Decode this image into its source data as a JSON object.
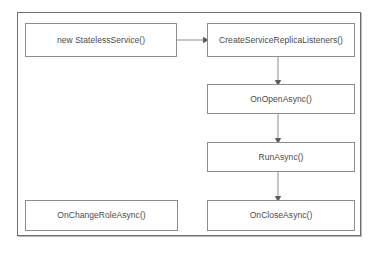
{
  "diagram": {
    "type": "flowchart",
    "frame": {
      "border_color": "#6e6e6e",
      "background": "#ffffff"
    },
    "node_style": {
      "border_color": "#8d8d8d",
      "fill": "#ffffff",
      "text_color": "#4a4a4a"
    },
    "connector_style": {
      "line_color": "#8d8d8d",
      "arrowhead_color": "#5d5d5d"
    },
    "nodes": [
      {
        "id": "stateless-service",
        "label": "new StatelessService()"
      },
      {
        "id": "create-listeners",
        "label": "CreateServiceReplicaListeners()"
      },
      {
        "id": "on-open-async",
        "label": "OnOpenAsync()"
      },
      {
        "id": "run-async",
        "label": "RunAsync()"
      },
      {
        "id": "on-close-async",
        "label": "OnCloseAsync()"
      },
      {
        "id": "on-change-role",
        "label": "OnChangeRoleAsync()"
      }
    ],
    "edges": [
      {
        "from": "stateless-service",
        "to": "create-listeners",
        "direction": "right"
      },
      {
        "from": "create-listeners",
        "to": "on-open-async",
        "direction": "down"
      },
      {
        "from": "on-open-async",
        "to": "run-async",
        "direction": "down"
      },
      {
        "from": "run-async",
        "to": "on-close-async",
        "direction": "down"
      }
    ]
  }
}
